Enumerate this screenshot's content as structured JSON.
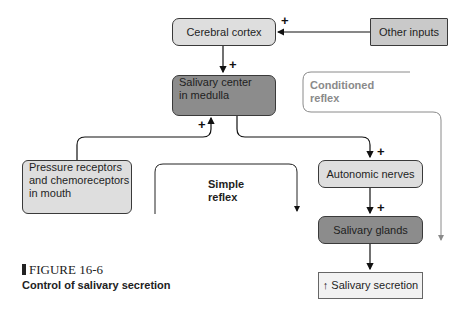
{
  "diagram": {
    "nodes": {
      "cerebral_cortex": "Cerebral cortex",
      "other_inputs": "Other inputs",
      "salivary_center": [
        "Salivary center",
        "in medulla"
      ],
      "pressure_receptors": [
        "Pressure receptors",
        "and chemoreceptors",
        "in mouth"
      ],
      "autonomic_nerves": "Autonomic nerves",
      "salivary_glands": "Salivary glands",
      "salivary_secretion": {
        "arrow": "↑",
        "text": "Salivary secretion"
      }
    },
    "path_labels": {
      "simple_reflex": [
        "Simple",
        "reflex"
      ],
      "conditioned_reflex": [
        "Conditioned",
        "reflex"
      ]
    },
    "signs": {
      "other_to_cortex": "+",
      "cortex_to_center": "+",
      "receptors_to_center": "+",
      "center_to_nerves": "+",
      "nerves_to_glands": "+"
    },
    "colors": {
      "light_box": "#dedede",
      "mid_box": "#c9c9c9",
      "dark_box": "#8c8c8c",
      "conditioned_line": "#8a8a8a"
    }
  },
  "figure": {
    "number": "FIGURE 16-6",
    "caption": "Control of salivary secretion"
  }
}
